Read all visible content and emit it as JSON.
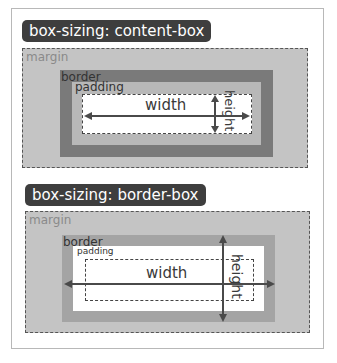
{
  "diagrams": [
    {
      "title": "box-sizing: content-box",
      "labels": {
        "margin": "margin",
        "border": "border",
        "padding": "padding",
        "width": "width",
        "height": "height"
      }
    },
    {
      "title": "box-sizing: border-box",
      "labels": {
        "margin": "margin",
        "border": "border",
        "padding": "padding",
        "width": "width",
        "height": "height"
      }
    }
  ],
  "colors": {
    "label_bg": "#3e3e3e",
    "margin": "#c4c4c4",
    "border_top": "#7a7a7a",
    "border_bottom": "#a4a4a4",
    "padding_top": "#b8b8b8",
    "padding_bottom": "#ffffff",
    "arrow": "#4a4a4a"
  }
}
